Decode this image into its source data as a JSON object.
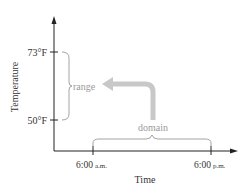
{
  "diagram": {
    "y_axis": {
      "label": "Temperature",
      "ticks": [
        {
          "label": "73°F"
        },
        {
          "label": "50°F"
        }
      ]
    },
    "x_axis": {
      "label": "Time",
      "ticks": [
        {
          "label_main": "6:00",
          "label_suffix": "a.m."
        },
        {
          "label_main": "6:00",
          "label_suffix": "p.m."
        }
      ]
    },
    "range_label": "range",
    "domain_label": "domain",
    "colors": {
      "axis": "#222222",
      "annotation": "#9a9a9a",
      "arrow": "#c8c8c8"
    }
  }
}
